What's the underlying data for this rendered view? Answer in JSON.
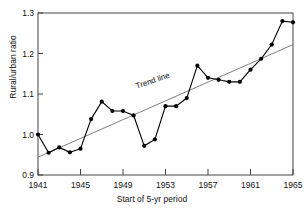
{
  "chart_data": {
    "type": "line",
    "title": "",
    "subtitle": "",
    "xlabel": "Start of 5-yr period",
    "ylabel": "Rural/urban ratio",
    "xlim": [
      1941,
      1965
    ],
    "ylim": [
      0.9,
      1.3
    ],
    "grid": false,
    "legend": null,
    "xticks": [
      "1941",
      "1945",
      "1949",
      "1953",
      "1957",
      "1961",
      "1965"
    ],
    "xtick_values": [
      1941,
      1945,
      1949,
      1953,
      1957,
      1961,
      1965
    ],
    "yticks": [
      "0.9",
      "1.0",
      "1.1",
      "1.2",
      "1.3"
    ],
    "ytick_values": [
      0.9,
      1.0,
      1.1,
      1.2,
      1.3
    ],
    "x": [
      1941,
      1942,
      1943,
      1944,
      1945,
      1946,
      1947,
      1948,
      1949,
      1950,
      1951,
      1952,
      1953,
      1954,
      1955,
      1956,
      1957,
      1958,
      1959,
      1960,
      1961,
      1962,
      1963,
      1964,
      1965
    ],
    "series": [
      {
        "name": "Rural/urban ratio",
        "marker": "filled-circle",
        "color": "#000000",
        "values": [
          1.0,
          0.955,
          0.968,
          0.956,
          0.965,
          1.038,
          1.081,
          1.058,
          1.058,
          1.047,
          0.972,
          0.988,
          1.07,
          1.07,
          1.09,
          1.17,
          1.14,
          1.135,
          1.13,
          1.13,
          1.16,
          1.187,
          1.222,
          1.28,
          1.277
        ]
      },
      {
        "name": "Trend line",
        "marker": "none",
        "color": "#808080",
        "x_endpoints": [
          1941,
          1965
        ],
        "y_endpoints": [
          0.944,
          1.222
        ]
      }
    ],
    "annotations": [
      {
        "text": "Trend line",
        "x": 1950.2,
        "y": 1.118,
        "rotation": -19
      }
    ]
  }
}
